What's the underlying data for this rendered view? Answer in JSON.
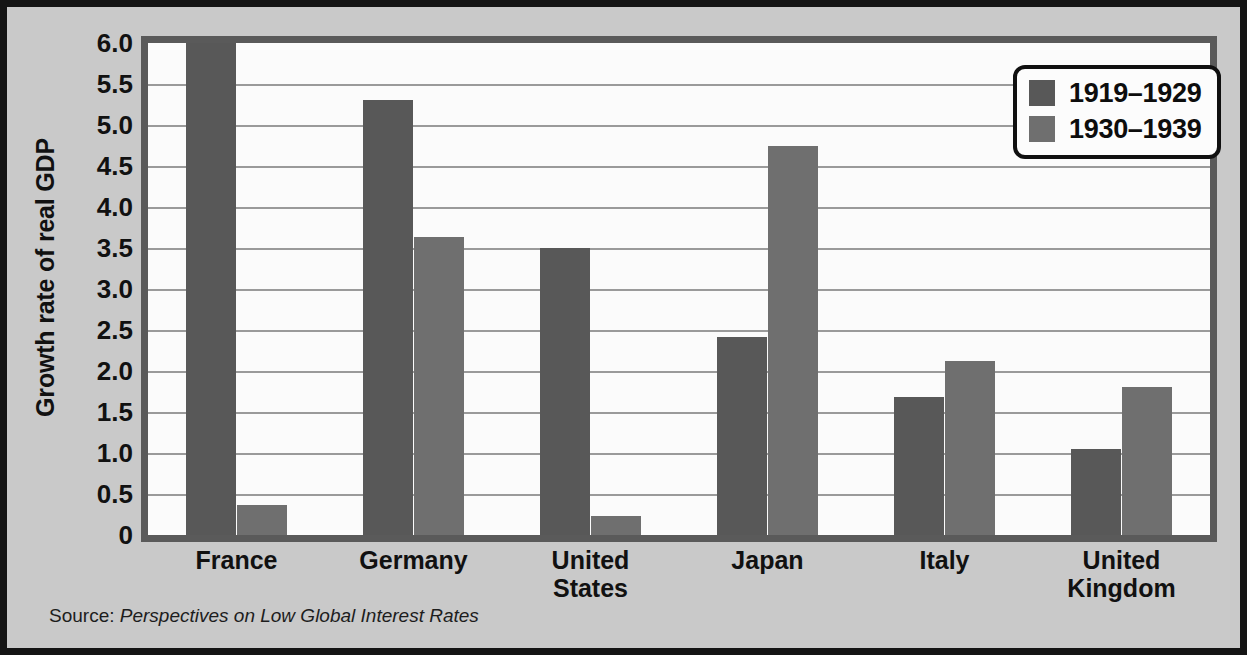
{
  "chart_data": {
    "type": "bar",
    "title": "",
    "xlabel": "",
    "ylabel": "Growth rate of real GDP",
    "categories": [
      "France",
      "Germany",
      "United States",
      "Japan",
      "Italy",
      "United Kingdom"
    ],
    "category_lines": [
      [
        "France"
      ],
      [
        "Germany"
      ],
      [
        "United",
        "States"
      ],
      [
        "Japan"
      ],
      [
        "Italy"
      ],
      [
        "United",
        "Kingdom"
      ]
    ],
    "series": [
      {
        "name": "1919–1929",
        "color": "#585858",
        "values": [
          6.0,
          5.3,
          3.5,
          2.42,
          1.68,
          1.05
        ]
      },
      {
        "name": "1930–1939",
        "color": "#6f6f6f",
        "values": [
          0.36,
          3.63,
          0.23,
          4.75,
          2.12,
          1.8
        ]
      }
    ],
    "ylim": [
      0,
      6.0
    ],
    "yticks": [
      0,
      0.5,
      1.0,
      1.5,
      2.0,
      2.5,
      3.0,
      3.5,
      4.0,
      4.5,
      5.0,
      5.5,
      6.0
    ],
    "ytick_labels": [
      "0",
      "0.5",
      "1.0",
      "1.5",
      "2.0",
      "2.5",
      "3.0",
      "3.5",
      "4.0",
      "4.5",
      "5.0",
      "5.5",
      "6.0"
    ],
    "grid": true,
    "grid_axis": "y",
    "legend_position": "top-right"
  },
  "legend": {
    "entries": [
      {
        "label": "1919–1929",
        "swatch": "series-0-swatch"
      },
      {
        "label": "1930–1939",
        "swatch": "series-1-swatch"
      }
    ]
  },
  "source": {
    "prefix": "Source: ",
    "title": "Perspectives on Low Global Interest Rates"
  },
  "colors": {
    "background": "#c9c9c9",
    "frame": "#141414",
    "plot_background": "#fbfbfb",
    "plot_border": "#5a5a5a",
    "gridline": "#9a9a9a",
    "series_0": "#585858",
    "series_1": "#6f6f6f",
    "text": "#111111"
  }
}
